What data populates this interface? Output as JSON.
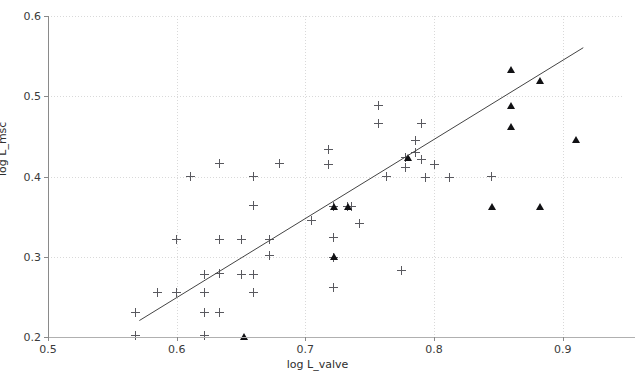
{
  "figure": {
    "width": 635,
    "height": 379,
    "background": "#ffffff",
    "marker_plus_color": "#59595f",
    "marker_triangle_color": "#111114",
    "fitline_color": "#444444",
    "grid_color": "#d9d9d9",
    "axis_color": "#8a8a8a"
  },
  "chart_data": {
    "type": "scatter",
    "title": "",
    "xlabel": "log L_valve",
    "ylabel": "log L_msc",
    "xlim": [
      0.5,
      0.9461
    ],
    "ylim": [
      0.2,
      0.6
    ],
    "xticks": [
      0.5,
      0.6,
      0.7,
      0.8,
      0.9
    ],
    "xticklabels": [
      "0.5",
      "0.6",
      "0.7",
      "0.8",
      "0.9"
    ],
    "yticks": [
      0.2,
      0.3,
      0.4,
      0.5,
      0.6
    ],
    "yticklabels": [
      "0.2",
      "0.3",
      "0.4",
      "0.5",
      "0.6"
    ],
    "grid": true,
    "grid_style": "dotted",
    "legend": null,
    "series": [
      {
        "name": "plus-markers",
        "marker": "plus",
        "color": "#59595f",
        "points": [
          [
            0.568,
            0.23
          ],
          [
            0.568,
            0.202
          ],
          [
            0.585,
            0.256
          ],
          [
            0.6,
            0.256
          ],
          [
            0.6,
            0.322
          ],
          [
            0.611,
            0.4
          ],
          [
            0.622,
            0.278
          ],
          [
            0.622,
            0.256
          ],
          [
            0.622,
            0.231
          ],
          [
            0.622,
            0.202
          ],
          [
            0.633,
            0.416
          ],
          [
            0.633,
            0.322
          ],
          [
            0.633,
            0.279
          ],
          [
            0.633,
            0.231
          ],
          [
            0.65,
            0.322
          ],
          [
            0.65,
            0.278
          ],
          [
            0.66,
            0.4
          ],
          [
            0.66,
            0.364
          ],
          [
            0.66,
            0.278
          ],
          [
            0.66,
            0.256
          ],
          [
            0.672,
            0.322
          ],
          [
            0.672,
            0.301
          ],
          [
            0.68,
            0.416
          ],
          [
            0.705,
            0.345
          ],
          [
            0.718,
            0.434
          ],
          [
            0.718,
            0.415
          ],
          [
            0.722,
            0.362
          ],
          [
            0.722,
            0.324
          ],
          [
            0.722,
            0.299
          ],
          [
            0.722,
            0.262
          ],
          [
            0.733,
            0.362
          ],
          [
            0.736,
            0.362
          ],
          [
            0.742,
            0.341
          ],
          [
            0.757,
            0.489
          ],
          [
            0.757,
            0.466
          ],
          [
            0.763,
            0.4
          ],
          [
            0.775,
            0.283
          ],
          [
            0.778,
            0.424
          ],
          [
            0.778,
            0.411
          ],
          [
            0.786,
            0.445
          ],
          [
            0.786,
            0.43
          ],
          [
            0.79,
            0.466
          ],
          [
            0.79,
            0.421
          ],
          [
            0.793,
            0.399
          ],
          [
            0.8,
            0.415
          ],
          [
            0.812,
            0.399
          ],
          [
            0.845,
            0.4
          ]
        ]
      },
      {
        "name": "triangle-markers",
        "marker": "triangle",
        "color": "#111114",
        "points": [
          [
            0.652,
            0.201
          ],
          [
            0.722,
            0.362
          ],
          [
            0.722,
            0.3
          ],
          [
            0.733,
            0.362
          ],
          [
            0.78,
            0.424
          ],
          [
            0.845,
            0.362
          ],
          [
            0.86,
            0.533
          ],
          [
            0.86,
            0.489
          ],
          [
            0.86,
            0.462
          ],
          [
            0.882,
            0.52
          ],
          [
            0.882,
            0.362
          ],
          [
            0.91,
            0.446
          ]
        ]
      }
    ],
    "fit_line": {
      "name": "regression-line",
      "color": "#444444",
      "x_start": 0.571,
      "y_start": 0.2205,
      "x_end": 0.916,
      "y_end": 0.5605
    }
  }
}
